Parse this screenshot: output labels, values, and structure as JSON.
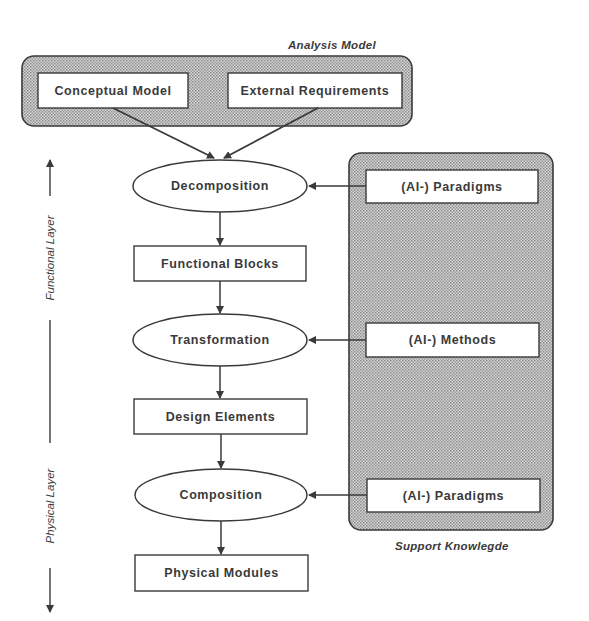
{
  "diagram": {
    "analysis_model": {
      "caption": "Analysis Model",
      "items": [
        "Conceptual Model",
        "External Requirements"
      ]
    },
    "support_knowledge": {
      "caption": "Support Knowlegde",
      "items": [
        "(AI-) Paradigms",
        "(AI-) Methods",
        "(AI-) Paradigms"
      ]
    },
    "flow": {
      "processes": [
        "Decomposition",
        "Transformation",
        "Composition"
      ],
      "artifacts": [
        "Functional Blocks",
        "Design Elements",
        "Physical Modules"
      ]
    },
    "layer_axis": {
      "upper_label": "Functional Layer",
      "lower_label": "Physical Layer"
    },
    "colors": {
      "stroke": "#3a3a3a",
      "hatch_fill": "#b8b8b8",
      "box_fill": "#ffffff"
    }
  }
}
